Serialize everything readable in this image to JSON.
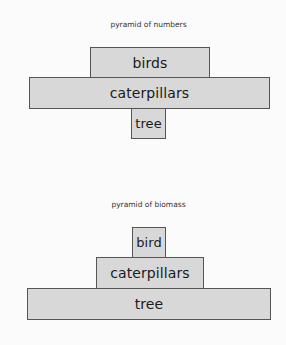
{
  "pyramid_numbers": {
    "title": "pyramid of numbers",
    "levels": [
      {
        "label": "birds"
      },
      {
        "label": "caterpillars"
      },
      {
        "label": "tree"
      }
    ]
  },
  "pyramid_biomass": {
    "title": "pyramid of biomass",
    "levels": [
      {
        "label": "bird"
      },
      {
        "label": "caterpillars"
      },
      {
        "label": "tree"
      }
    ]
  },
  "colors": {
    "box_fill": "#d8d8d8",
    "box_border": "#555555",
    "background": "#fbfbfb"
  }
}
